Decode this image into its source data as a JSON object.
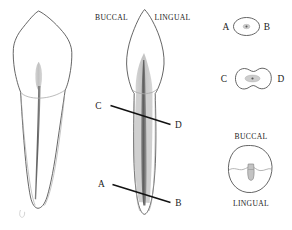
{
  "figure": {
    "colors": {
      "outline": "#4a4a4a",
      "outline_light": "#9a9a9a",
      "pulp_fill": "#c9c9c9",
      "canal_fill": "#6e6e6e",
      "canal_dark": "#555555",
      "label_text": "#1a1a1a",
      "pointer_line": "#111111",
      "background": "#ffffff"
    }
  },
  "views": {
    "proximal": {
      "name": "proximal-view-tooth",
      "description": "Mesial or distal longitudinal section of mandibular incisor"
    },
    "facial": {
      "name": "facial-view-tooth",
      "description": "Labial longitudinal section of mandibular incisor",
      "top_labels": {
        "buccal": "BUCCAL",
        "lingual": "LINGUAL"
      },
      "section_lines": [
        {
          "id": "cd",
          "left_label": "C",
          "right_label": "D"
        },
        {
          "id": "ab",
          "left_label": "A",
          "right_label": "B"
        }
      ]
    }
  },
  "cross_sections": [
    {
      "id": "section-ab",
      "name": "cross-section-ab",
      "left_label": "A",
      "right_label": "B",
      "shape": "oval",
      "canal_count": 1
    },
    {
      "id": "section-cd",
      "name": "cross-section-cd",
      "left_label": "C",
      "right_label": "D",
      "shape": "hourglass-kidney",
      "canal_count": 1
    },
    {
      "id": "section-cervical",
      "name": "cross-section-cervical",
      "top_label": "BUCCAL",
      "bottom_label": "LINGUAL",
      "shape": "rounded-triangular",
      "canal_count": 1
    }
  ]
}
